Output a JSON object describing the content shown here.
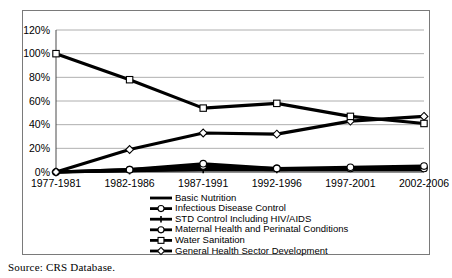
{
  "figure": {
    "source_note": "Source: CRS Database."
  },
  "chart_data": {
    "type": "line",
    "title": "",
    "xlabel": "",
    "ylabel": "",
    "ylim": [
      0,
      120
    ],
    "yticks": [
      0,
      20,
      40,
      60,
      80,
      100,
      120
    ],
    "ytick_labels": [
      "0%",
      "20%",
      "40%",
      "60%",
      "80%",
      "100%",
      "120%"
    ],
    "grid": true,
    "legend_position": "bottom-center",
    "categories": [
      "1977-1981",
      "1982-1986",
      "1987-1991",
      "1992-1996",
      "1997-2001",
      "2002-2006"
    ],
    "series": [
      {
        "name": "Basic Nutrition",
        "marker": "none",
        "values": [
          0,
          1,
          3,
          2,
          2,
          2
        ]
      },
      {
        "name": "Infectious Disease Control",
        "marker": "circle",
        "values": [
          0,
          2,
          7,
          3,
          4,
          5
        ]
      },
      {
        "name": "STD Control Including HIV/AIDS",
        "marker": "plus",
        "values": [
          0,
          1,
          2,
          2,
          3,
          4
        ]
      },
      {
        "name": "Maternal Health and Perinatal Conditions",
        "marker": "circle-open",
        "values": [
          0,
          2,
          5,
          3,
          3,
          3
        ]
      },
      {
        "name": "Water Sanitation",
        "marker": "square",
        "values": [
          100,
          78,
          54,
          58,
          47,
          41
        ]
      },
      {
        "name": "General Health Sector Development",
        "marker": "diamond",
        "values": [
          0,
          19,
          33,
          32,
          43,
          47
        ]
      }
    ]
  }
}
